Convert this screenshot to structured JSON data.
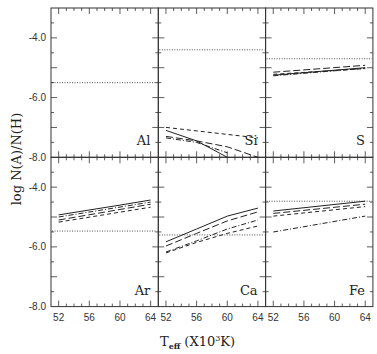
{
  "chart_data": {
    "type": "line",
    "layout": "2x3 grid of panels with shared axes",
    "xlabel": "T_eff (X10^3K)",
    "xlabel_main": "T",
    "xlabel_sub": "eff",
    "xlabel_unit": "(X10",
    "xlabel_sup": "3",
    "xlabel_end": "K)",
    "ylabel": "log N(A)/N(H)",
    "xlim": [
      51,
      65
    ],
    "ylim": [
      -8.0,
      -3.0
    ],
    "xticks": [
      52,
      56,
      60,
      64
    ],
    "xtick_labels": [
      "52",
      "56",
      "60",
      "64"
    ],
    "yticks": [
      -4.0,
      -6.0,
      -8.0
    ],
    "ytick_labels": [
      "-4.0",
      "-6.0",
      "-8.0"
    ],
    "grid": false,
    "legend": "none",
    "line_styles": [
      "solid",
      "long-dash",
      "short-dash",
      "dash-dot",
      "dotted (reference)"
    ],
    "panels": [
      {
        "element": "Al",
        "row": 0,
        "col": 0,
        "reference_dotted": -5.5,
        "series": []
      },
      {
        "element": "Si",
        "row": 0,
        "col": 1,
        "reference_dotted": -4.4,
        "series": [
          {
            "style": "solid",
            "x": [
              52,
              56,
              60
            ],
            "y": [
              -7.1,
              -7.45,
              -8.0
            ]
          },
          {
            "style": "short-dash",
            "x": [
              52,
              64
            ],
            "y": [
              -7.0,
              -7.35
            ]
          },
          {
            "style": "long-dash",
            "x": [
              52,
              56,
              60,
              64
            ],
            "y": [
              -7.3,
              -7.45,
              -7.65,
              -8.0
            ]
          },
          {
            "style": "dash-dot",
            "x": [
              52,
              56,
              60
            ],
            "y": [
              -7.35,
              -7.5,
              -7.85
            ]
          }
        ]
      },
      {
        "element": "S",
        "row": 0,
        "col": 2,
        "reference_dotted": -4.7,
        "series": [
          {
            "style": "solid",
            "x": [
              52,
              64
            ],
            "y": [
              -5.25,
              -5.0
            ]
          },
          {
            "style": "long-dash",
            "x": [
              52,
              64
            ],
            "y": [
              -5.15,
              -4.92
            ]
          },
          {
            "style": "short-dash",
            "x": [
              52,
              64
            ],
            "y": [
              -5.22,
              -5.03
            ]
          },
          {
            "style": "dash-dot",
            "x": [
              52,
              64
            ],
            "y": [
              -5.27,
              -5.02
            ]
          }
        ]
      },
      {
        "element": "Ar",
        "row": 1,
        "col": 0,
        "reference_dotted": -5.47,
        "series": [
          {
            "style": "solid",
            "x": [
              52,
              60,
              64
            ],
            "y": [
              -4.93,
              -4.6,
              -4.43
            ]
          },
          {
            "style": "dash-dot",
            "x": [
              52,
              64
            ],
            "y": [
              -5.0,
              -4.5
            ]
          },
          {
            "style": "long-dash",
            "x": [
              52,
              64
            ],
            "y": [
              -5.1,
              -4.57
            ]
          },
          {
            "style": "short-dash",
            "x": [
              52,
              64
            ],
            "y": [
              -5.17,
              -4.67
            ]
          }
        ]
      },
      {
        "element": "Ca",
        "row": 1,
        "col": 1,
        "reference_dotted": -5.6,
        "series": [
          {
            "style": "solid",
            "x": [
              52,
              56,
              60,
              64
            ],
            "y": [
              -5.83,
              -5.4,
              -4.97,
              -4.7
            ]
          },
          {
            "style": "long-dash",
            "x": [
              52,
              56,
              60,
              64
            ],
            "y": [
              -5.97,
              -5.55,
              -5.13,
              -4.83
            ]
          },
          {
            "style": "dash-dot",
            "x": [
              52,
              56,
              60,
              64
            ],
            "y": [
              -6.17,
              -5.8,
              -5.4,
              -5.1
            ]
          },
          {
            "style": "short-dash",
            "x": [
              52,
              56,
              60,
              64
            ],
            "y": [
              -6.2,
              -5.85,
              -5.55,
              -5.3
            ]
          }
        ]
      },
      {
        "element": "Fe",
        "row": 1,
        "col": 2,
        "reference_dotted": -4.47,
        "series": [
          {
            "style": "solid",
            "x": [
              52,
              64
            ],
            "y": [
              -4.8,
              -4.47
            ]
          },
          {
            "style": "long-dash",
            "x": [
              52,
              64
            ],
            "y": [
              -4.88,
              -4.57
            ]
          },
          {
            "style": "short-dash",
            "x": [
              52,
              64
            ],
            "y": [
              -4.97,
              -4.65
            ]
          },
          {
            "style": "dash-dot",
            "x": [
              52,
              64
            ],
            "y": [
              -5.5,
              -4.97
            ]
          }
        ]
      }
    ]
  },
  "colors": {
    "axis": "#333333",
    "line": "#222222",
    "background": "#ffffff"
  }
}
